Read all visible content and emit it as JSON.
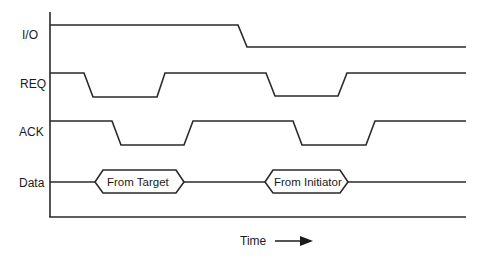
{
  "diagram": {
    "type": "timing-diagram",
    "signals": [
      {
        "name": "I/O",
        "label": "I/O",
        "y_label": 36
      },
      {
        "name": "REQ",
        "label": "REQ",
        "y_label": 85
      },
      {
        "name": "ACK",
        "label": "ACK",
        "y_label": 133
      },
      {
        "name": "Data",
        "label": "Data",
        "y_label": 186
      }
    ],
    "data_phases": [
      {
        "label": "From Target"
      },
      {
        "label": "From Initiator"
      }
    ],
    "time_axis": {
      "label": "Time",
      "arrow": "right-arrow"
    },
    "colors": {
      "line": "#2a2a2a",
      "text": "#1a1a1a",
      "background": "#ffffff"
    }
  }
}
